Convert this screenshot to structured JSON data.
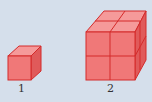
{
  "figures": [
    {
      "label": "1",
      "cubes_per_edge": 1
    },
    {
      "label": "2",
      "cubes_per_edge": 2
    }
  ],
  "colors": {
    "background": "#d5dfeb",
    "front": "#f07878",
    "top": "#f59a9a",
    "side": "#e05a5a",
    "edge": "#d42a2a"
  }
}
